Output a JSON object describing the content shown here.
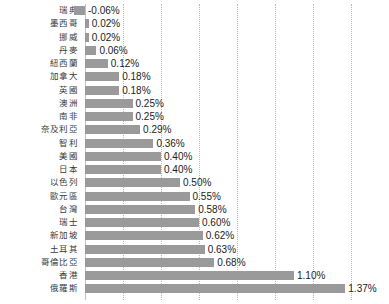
{
  "chart_data": {
    "type": "bar",
    "orientation": "horizontal",
    "title": "",
    "subtitle": "",
    "xlabel": "",
    "ylabel": "",
    "xlim": [
      -0.1,
      1.5
    ],
    "grid": true,
    "grid_axis": "x",
    "legend": false,
    "value_suffix": "%",
    "value_format": "0.00%",
    "bar_color": "#9a9a9a",
    "gridline_color": "#b9b9b9",
    "zero_line_color": "#c2c2c2",
    "label_color": "#3b3b3b",
    "value_color": "#1c1c1c",
    "categories": [
      "瑞典",
      "墨西哥",
      "挪威",
      "丹麥",
      "紐西蘭",
      "加拿大",
      "英國",
      "澳洲",
      "南非",
      "奈及利亞",
      "智利",
      "美國",
      "日本",
      "以色列",
      "歐元區",
      "台灣",
      "瑞士",
      "新加坡",
      "土耳其",
      "哥倫比亞",
      "香港",
      "俄羅斯"
    ],
    "values": [
      -0.06,
      0.02,
      0.02,
      0.06,
      0.12,
      0.18,
      0.18,
      0.25,
      0.25,
      0.29,
      0.36,
      0.4,
      0.4,
      0.5,
      0.55,
      0.58,
      0.6,
      0.62,
      0.63,
      0.68,
      1.1,
      1.37
    ],
    "value_labels": [
      "-0.06%",
      "0.02%",
      "0.02%",
      "0.06%",
      "0.12%",
      "0.18%",
      "0.18%",
      "0.25%",
      "0.25%",
      "0.29%",
      "0.36%",
      "0.40%",
      "0.40%",
      "0.50%",
      "0.55%",
      "0.58%",
      "0.60%",
      "0.62%",
      "0.63%",
      "0.68%",
      "1.10%",
      "1.37%"
    ],
    "gridline_values": [
      0.0,
      0.2,
      0.4,
      0.6,
      0.8,
      1.0,
      1.2,
      1.4
    ]
  }
}
